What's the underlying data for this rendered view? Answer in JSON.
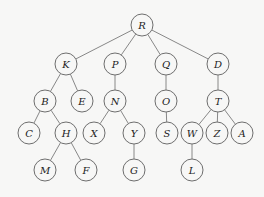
{
  "diagram": {
    "type": "tree",
    "root": "R",
    "node_radius": 11,
    "nodes": [
      {
        "id": "R",
        "label": "R",
        "x": 142,
        "y": 25
      },
      {
        "id": "K",
        "label": "K",
        "x": 66,
        "y": 64
      },
      {
        "id": "P",
        "label": "P",
        "x": 115,
        "y": 64
      },
      {
        "id": "Q",
        "label": "Q",
        "x": 166,
        "y": 64
      },
      {
        "id": "D",
        "label": "D",
        "x": 218,
        "y": 64
      },
      {
        "id": "B",
        "label": "B",
        "x": 45,
        "y": 101
      },
      {
        "id": "E",
        "label": "E",
        "x": 82,
        "y": 101
      },
      {
        "id": "N",
        "label": "N",
        "x": 115,
        "y": 101
      },
      {
        "id": "O",
        "label": "O",
        "x": 166,
        "y": 101
      },
      {
        "id": "T",
        "label": "T",
        "x": 218,
        "y": 101
      },
      {
        "id": "C",
        "label": "C",
        "x": 29,
        "y": 133
      },
      {
        "id": "H",
        "label": "H",
        "x": 66,
        "y": 133
      },
      {
        "id": "X",
        "label": "X",
        "x": 94,
        "y": 133
      },
      {
        "id": "Y",
        "label": "Y",
        "x": 134,
        "y": 133
      },
      {
        "id": "S",
        "label": "S",
        "x": 167,
        "y": 133
      },
      {
        "id": "W",
        "label": "W",
        "x": 192,
        "y": 133
      },
      {
        "id": "Z",
        "label": "Z",
        "x": 217,
        "y": 133
      },
      {
        "id": "A",
        "label": "A",
        "x": 242,
        "y": 133
      },
      {
        "id": "M",
        "label": "M",
        "x": 45,
        "y": 170
      },
      {
        "id": "F",
        "label": "F",
        "x": 86,
        "y": 170
      },
      {
        "id": "G",
        "label": "G",
        "x": 134,
        "y": 170
      },
      {
        "id": "L",
        "label": "L",
        "x": 192,
        "y": 170
      }
    ],
    "edges": [
      [
        "R",
        "K"
      ],
      [
        "R",
        "P"
      ],
      [
        "R",
        "Q"
      ],
      [
        "R",
        "D"
      ],
      [
        "K",
        "B"
      ],
      [
        "K",
        "E"
      ],
      [
        "P",
        "N"
      ],
      [
        "Q",
        "O"
      ],
      [
        "D",
        "T"
      ],
      [
        "B",
        "C"
      ],
      [
        "B",
        "H"
      ],
      [
        "N",
        "X"
      ],
      [
        "N",
        "Y"
      ],
      [
        "O",
        "S"
      ],
      [
        "T",
        "W"
      ],
      [
        "T",
        "Z"
      ],
      [
        "T",
        "A"
      ],
      [
        "H",
        "M"
      ],
      [
        "H",
        "F"
      ],
      [
        "Y",
        "G"
      ],
      [
        "W",
        "L"
      ]
    ]
  }
}
